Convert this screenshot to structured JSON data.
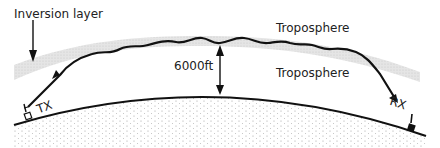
{
  "diagram": {
    "labels": {
      "inversion_layer": "Inversion layer",
      "troposphere_upper": "Troposphere",
      "troposphere_lower": "Troposphere",
      "height": "6000ft",
      "transmitter": "TX",
      "receiver": "RX"
    },
    "colors": {
      "line": "#111111",
      "inversion_band": "#d8d8d8",
      "ground_dots": "#777777",
      "background": "#ffffff"
    }
  }
}
